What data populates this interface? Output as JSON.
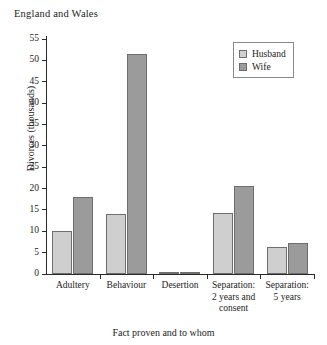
{
  "chart_data": {
    "type": "bar",
    "title": "England and Wales",
    "xlabel": "Fact proven and to whom",
    "ylabel": "Divorces (thousands)",
    "categories": [
      "Adultery",
      "Behaviour",
      "Desertion",
      "Separation:\n2 years and\nconsent",
      "Separation:\n5 years"
    ],
    "category_lines": [
      [
        "Adultery"
      ],
      [
        "Behaviour"
      ],
      [
        "Desertion"
      ],
      [
        "Separation:",
        "2 years and",
        "consent"
      ],
      [
        "Separation:",
        "5 years"
      ]
    ],
    "series": [
      {
        "name": "Husband",
        "color": "#cfcfcf",
        "values": [
          10.0,
          14.0,
          0.3,
          14.3,
          6.3
        ]
      },
      {
        "name": "Wife",
        "color": "#9b9b9b",
        "values": [
          18.0,
          51.5,
          0.3,
          20.5,
          7.3
        ]
      }
    ],
    "ylim": [
      0,
      55
    ],
    "ytick_values": [
      0,
      5,
      10,
      15,
      20,
      25,
      30,
      35,
      40,
      45,
      50,
      55
    ],
    "ytick_labels": [
      "0",
      "5",
      "10",
      "15",
      "20",
      "25",
      "30",
      "35",
      "40",
      "45",
      "50",
      "55"
    ],
    "grid": false,
    "legend_position": "top-right",
    "legend_entries": [
      "Husband",
      "Wife"
    ]
  }
}
